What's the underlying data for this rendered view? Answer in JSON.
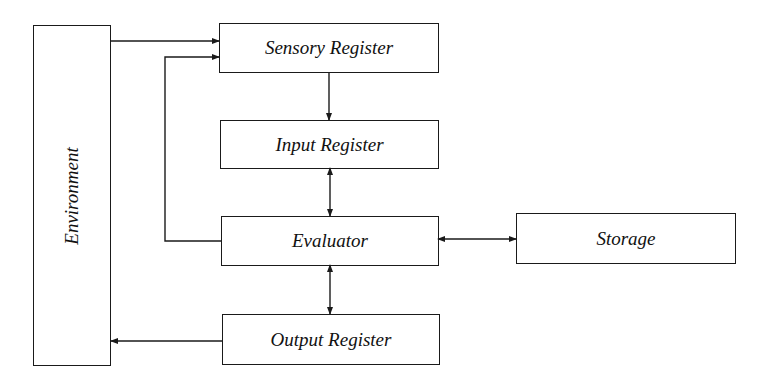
{
  "diagram": {
    "type": "block-diagram",
    "nodes": {
      "environment": {
        "label": "Environment"
      },
      "sensory_register": {
        "label": "Sensory Register"
      },
      "input_register": {
        "label": "Input Register"
      },
      "evaluator": {
        "label": "Evaluator"
      },
      "output_register": {
        "label": "Output Register"
      },
      "storage": {
        "label": "Storage"
      }
    },
    "edges": [
      {
        "from": "Environment",
        "to": "Sensory Register",
        "direction": "one-way"
      },
      {
        "from": "Evaluator",
        "to": "Sensory Register",
        "direction": "one-way",
        "route": "feedback loop on left"
      },
      {
        "from": "Sensory Register",
        "to": "Input Register",
        "direction": "one-way"
      },
      {
        "from": "Input Register",
        "to": "Evaluator",
        "direction": "two-way"
      },
      {
        "from": "Evaluator",
        "to": "Storage",
        "direction": "two-way"
      },
      {
        "from": "Evaluator",
        "to": "Output Register",
        "direction": "two-way"
      },
      {
        "from": "Output Register",
        "to": "Environment",
        "direction": "one-way"
      }
    ],
    "colors": {
      "stroke": "#1a1a1a",
      "background": "#ffffff"
    }
  }
}
